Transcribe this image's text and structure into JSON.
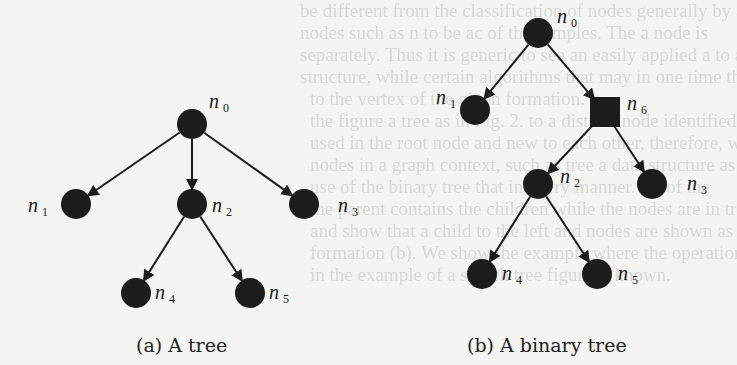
{
  "background_bleed_lines": [
    "be different from the classification of nodes generally by a",
    "nodes such as n to be ac of the samples. The a node is",
    "separately. Thus it is generic to see an easily applied a to all",
    "structure, while certain algorithms that may in one time the no",
    "to the vertex of the given formation.",
    "the figure a tree as in Fig. 2. to a distinct node identified in",
    "used in the root node and new to each other, therefore, with",
    "nodes in a graph context, such as tree a data structure as in Fig.",
    "use of the binary tree that in every manner. Xs of the",
    "the parent contains the children while the nodes are in tree",
    "and show that a child to the left and nodes are shown as at",
    "formation (b). We show the example where the operation is of random us",
    "in the example of a search tree figure is known."
  ],
  "figures": [
    {
      "id": "a",
      "caption": "(a) A tree",
      "nodes": [
        {
          "id": "n0",
          "name": "n",
          "sub": "0",
          "shape": "circle",
          "x": 192,
          "y": 124
        },
        {
          "id": "n1",
          "name": "n",
          "sub": "1",
          "shape": "circle",
          "x": 76,
          "y": 204
        },
        {
          "id": "n2",
          "name": "n",
          "sub": "2",
          "shape": "circle",
          "x": 192,
          "y": 204
        },
        {
          "id": "n3",
          "name": "n",
          "sub": "3",
          "shape": "circle",
          "x": 304,
          "y": 204
        },
        {
          "id": "n4",
          "name": "n",
          "sub": "4",
          "shape": "circle",
          "x": 136,
          "y": 293
        },
        {
          "id": "n5",
          "name": "n",
          "sub": "5",
          "shape": "circle",
          "x": 250,
          "y": 293
        }
      ],
      "edges": [
        [
          "n0",
          "n1"
        ],
        [
          "n0",
          "n2"
        ],
        [
          "n0",
          "n3"
        ],
        [
          "n2",
          "n4"
        ],
        [
          "n2",
          "n5"
        ]
      ]
    },
    {
      "id": "b",
      "caption": "(b) A binary tree",
      "nodes": [
        {
          "id": "n0",
          "name": "n",
          "sub": "0",
          "shape": "circle",
          "x": 538,
          "y": 33
        },
        {
          "id": "n1",
          "name": "n",
          "sub": "1",
          "shape": "circle",
          "x": 475,
          "y": 110
        },
        {
          "id": "n6",
          "name": "n",
          "sub": "6",
          "shape": "square",
          "x": 605,
          "y": 112
        },
        {
          "id": "n2",
          "name": "n",
          "sub": "2",
          "shape": "circle",
          "x": 538,
          "y": 184
        },
        {
          "id": "n3",
          "name": "n",
          "sub": "3",
          "shape": "circle",
          "x": 652,
          "y": 184
        },
        {
          "id": "n4",
          "name": "n",
          "sub": "4",
          "shape": "circle",
          "x": 482,
          "y": 274
        },
        {
          "id": "n5",
          "name": "n",
          "sub": "5",
          "shape": "circle",
          "x": 597,
          "y": 274
        }
      ],
      "edges": [
        [
          "n0",
          "n1"
        ],
        [
          "n0",
          "n6"
        ],
        [
          "n6",
          "n2"
        ],
        [
          "n6",
          "n3"
        ],
        [
          "n2",
          "n4"
        ],
        [
          "n2",
          "n5"
        ]
      ]
    }
  ],
  "colors": {
    "node": "#1c1c1c",
    "edge": "#1c1c1c",
    "text": "#1a1a1a",
    "background": "#f4f4f2"
  }
}
